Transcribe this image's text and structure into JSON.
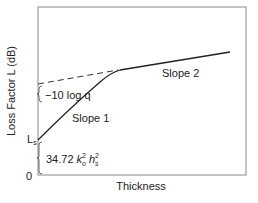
{
  "diagram": {
    "type": "line-sketch",
    "y_axis_label": "Loss Factor L (dB)",
    "x_axis_label": "Thickness",
    "origin_label": "0",
    "ls_label_main": "L",
    "ls_label_sub": "s",
    "log_label": "−10 log q",
    "formula": {
      "coef": "34.72 ",
      "k": "k",
      "k_sup": "2",
      "k_sub": "o",
      "h": " h",
      "h_sup": "2",
      "h_sub": "s"
    },
    "slope1_label": "Slope 1",
    "slope2_label": "Slope 2",
    "colors": {
      "axis": "#7a7a7a",
      "line": "#222222",
      "dashed": "#333333",
      "text": "#222222"
    }
  }
}
